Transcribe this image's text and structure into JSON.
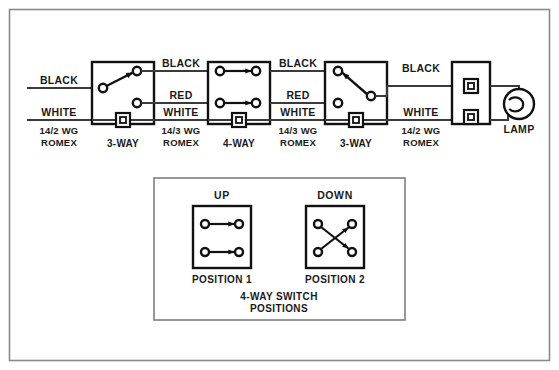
{
  "diagram": {
    "border_color": "#8a8a8a",
    "wire_color": "#3a3a3a",
    "box_color": "#111111",
    "background": "#ffffff"
  },
  "wires": {
    "black": "BLACK",
    "red": "RED",
    "white": "WHITE"
  },
  "cables": [
    {
      "id": "cable-left",
      "line1": "14/2 WG",
      "line2": "ROMEX"
    },
    {
      "id": "cable-mid-1",
      "line1": "14/3 WG",
      "line2": "ROMEX"
    },
    {
      "id": "cable-mid-2",
      "line1": "14/3 WG",
      "line2": "ROMEX"
    },
    {
      "id": "cable-right",
      "line1": "14/2 WG",
      "line2": "ROMEX"
    }
  ],
  "devices": [
    {
      "id": "switch-3way-left",
      "label": "3-WAY"
    },
    {
      "id": "switch-4way",
      "label": "4-WAY"
    },
    {
      "id": "switch-3way-right",
      "label": "3-WAY"
    },
    {
      "id": "lamp",
      "label": "LAMP"
    }
  ],
  "wire_labels": {
    "left_black": "BLACK",
    "left_white": "WHITE",
    "mid1_black": "BLACK",
    "mid1_red": "RED",
    "mid1_white": "WHITE",
    "mid2_black": "BLACK",
    "mid2_red": "RED",
    "mid2_white": "WHITE",
    "right_black": "BLACK",
    "right_white": "WHITE"
  },
  "legend": {
    "caption_line1": "4-WAY SWITCH",
    "caption_line2": "POSITIONS",
    "positions": [
      {
        "id": "position-1",
        "heading": "UP",
        "label": "POSITION 1",
        "wiring": "parallel"
      },
      {
        "id": "position-2",
        "heading": "DOWN",
        "label": "POSITION 2",
        "wiring": "crossed"
      }
    ]
  }
}
